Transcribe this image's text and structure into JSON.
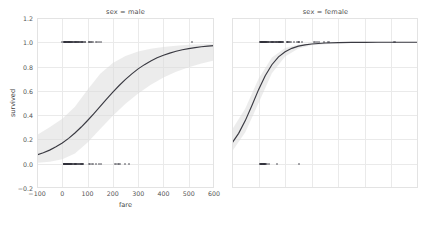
{
  "figure": {
    "kind": "logistic-regression-facet-grid",
    "background": "#ffffff",
    "curve_color": "#3a3a42",
    "band_color": "#d9d9d9",
    "point_color": "#31313a",
    "grid_color": "#eaeaea",
    "frame_color": "#e3e3e3"
  },
  "chart_data": {
    "type": "line",
    "title": "",
    "subtitle": "",
    "xlabel": "fare",
    "ylabel": "survived",
    "xlim": [
      -100,
      600
    ],
    "ylim": [
      -0.2,
      1.2
    ],
    "xticks": [
      -100,
      0,
      100,
      200,
      300,
      400,
      500,
      600
    ],
    "xticklabels": [
      "−100",
      "0",
      "100",
      "200",
      "300",
      "400",
      "500",
      "600"
    ],
    "yticks": [
      -0.2,
      0.0,
      0.2,
      0.4,
      0.6,
      0.8,
      1.0,
      1.2
    ],
    "yticklabels": [
      "−0.2",
      "0.0",
      "0.2",
      "0.4",
      "0.6",
      "0.8",
      "1.0",
      "1.2"
    ],
    "grid": true,
    "legend": "none",
    "facet_variable": "sex",
    "panels": [
      {
        "title": "sex = male",
        "facet_value": "male",
        "series": [
          {
            "name": "logistic fit",
            "x": [
              -100,
              -75,
              -50,
              -25,
              0,
              25,
              50,
              75,
              100,
              125,
              150,
              175,
              200,
              225,
              250,
              275,
              300,
              325,
              350,
              375,
              400,
              425,
              450,
              475,
              500,
              525,
              550,
              575,
              600
            ],
            "values": [
              0.072,
              0.09,
              0.112,
              0.139,
              0.171,
              0.209,
              0.253,
              0.302,
              0.356,
              0.413,
              0.472,
              0.531,
              0.589,
              0.644,
              0.694,
              0.74,
              0.781,
              0.816,
              0.846,
              0.872,
              0.893,
              0.911,
              0.926,
              0.938,
              0.948,
              0.956,
              0.963,
              0.968,
              0.973
            ]
          },
          {
            "name": "95% confidence band lower",
            "x": [
              -100,
              -50,
              0,
              50,
              100,
              150,
              200,
              250,
              300,
              350,
              400,
              450,
              500,
              550,
              600
            ],
            "values": [
              0.008,
              0.016,
              0.036,
              0.085,
              0.175,
              0.286,
              0.396,
              0.494,
              0.578,
              0.65,
              0.709,
              0.757,
              0.795,
              0.826,
              0.851
            ]
          },
          {
            "name": "95% confidence band upper",
            "x": [
              -100,
              -50,
              0,
              50,
              100,
              150,
              200,
              250,
              300,
              350,
              400,
              450,
              500,
              550,
              600
            ],
            "values": [
              0.236,
              0.3,
              0.37,
              0.47,
              0.61,
              0.74,
              0.83,
              0.888,
              0.924,
              0.947,
              0.962,
              0.972,
              0.979,
              0.984,
              0.988
            ]
          }
        ],
        "points": [
          {
            "x": 51,
            "y": 1
          },
          {
            "x": 53,
            "y": 1
          },
          {
            "x": 26,
            "y": 1
          },
          {
            "x": 13,
            "y": 1
          },
          {
            "x": 30,
            "y": 1
          },
          {
            "x": 35,
            "y": 1
          },
          {
            "x": 11,
            "y": 1
          },
          {
            "x": 8,
            "y": 1
          },
          {
            "x": 0,
            "y": 1
          },
          {
            "x": 7,
            "y": 1
          },
          {
            "x": 9,
            "y": 1
          },
          {
            "x": 10,
            "y": 1
          },
          {
            "x": 12,
            "y": 1
          },
          {
            "x": 15,
            "y": 1
          },
          {
            "x": 18,
            "y": 1
          },
          {
            "x": 20,
            "y": 1
          },
          {
            "x": 21,
            "y": 1
          },
          {
            "x": 23,
            "y": 1
          },
          {
            "x": 25,
            "y": 1
          },
          {
            "x": 27,
            "y": 1
          },
          {
            "x": 29,
            "y": 1
          },
          {
            "x": 31,
            "y": 1
          },
          {
            "x": 33,
            "y": 1
          },
          {
            "x": 39,
            "y": 1
          },
          {
            "x": 40,
            "y": 1
          },
          {
            "x": 41,
            "y": 1
          },
          {
            "x": 46,
            "y": 1
          },
          {
            "x": 52,
            "y": 1
          },
          {
            "x": 56,
            "y": 1
          },
          {
            "x": 57,
            "y": 1
          },
          {
            "x": 61,
            "y": 1
          },
          {
            "x": 63,
            "y": 1
          },
          {
            "x": 65,
            "y": 1
          },
          {
            "x": 66,
            "y": 1
          },
          {
            "x": 71,
            "y": 1
          },
          {
            "x": 73,
            "y": 1
          },
          {
            "x": 75,
            "y": 1
          },
          {
            "x": 78,
            "y": 1
          },
          {
            "x": 79,
            "y": 1
          },
          {
            "x": 81,
            "y": 1
          },
          {
            "x": 83,
            "y": 1
          },
          {
            "x": 90,
            "y": 1
          },
          {
            "x": 91,
            "y": 1
          },
          {
            "x": 106,
            "y": 1
          },
          {
            "x": 108,
            "y": 1
          },
          {
            "x": 113,
            "y": 1
          },
          {
            "x": 120,
            "y": 1
          },
          {
            "x": 135,
            "y": 1
          },
          {
            "x": 146,
            "y": 1
          },
          {
            "x": 153,
            "y": 1
          },
          {
            "x": 512,
            "y": 1
          },
          {
            "x": 7,
            "y": 0
          },
          {
            "x": 8,
            "y": 0
          },
          {
            "x": 7.9,
            "y": 0
          },
          {
            "x": 8.05,
            "y": 0
          },
          {
            "x": 8.5,
            "y": 0
          },
          {
            "x": 9,
            "y": 0
          },
          {
            "x": 10,
            "y": 0
          },
          {
            "x": 11,
            "y": 0
          },
          {
            "x": 12,
            "y": 0
          },
          {
            "x": 13,
            "y": 0
          },
          {
            "x": 14,
            "y": 0
          },
          {
            "x": 15,
            "y": 0
          },
          {
            "x": 16,
            "y": 0
          },
          {
            "x": 17,
            "y": 0
          },
          {
            "x": 18,
            "y": 0
          },
          {
            "x": 19,
            "y": 0
          },
          {
            "x": 20,
            "y": 0
          },
          {
            "x": 21,
            "y": 0
          },
          {
            "x": 22,
            "y": 0
          },
          {
            "x": 23,
            "y": 0
          },
          {
            "x": 24,
            "y": 0
          },
          {
            "x": 25,
            "y": 0
          },
          {
            "x": 26,
            "y": 0
          },
          {
            "x": 27,
            "y": 0
          },
          {
            "x": 29,
            "y": 0
          },
          {
            "x": 30,
            "y": 0
          },
          {
            "x": 31,
            "y": 0
          },
          {
            "x": 33,
            "y": 0
          },
          {
            "x": 34,
            "y": 0
          },
          {
            "x": 35,
            "y": 0
          },
          {
            "x": 37,
            "y": 0
          },
          {
            "x": 39,
            "y": 0
          },
          {
            "x": 41,
            "y": 0
          },
          {
            "x": 46,
            "y": 0
          },
          {
            "x": 49,
            "y": 0
          },
          {
            "x": 50,
            "y": 0
          },
          {
            "x": 52,
            "y": 0
          },
          {
            "x": 53,
            "y": 0
          },
          {
            "x": 55,
            "y": 0
          },
          {
            "x": 56,
            "y": 0
          },
          {
            "x": 61,
            "y": 0
          },
          {
            "x": 63,
            "y": 0
          },
          {
            "x": 66,
            "y": 0
          },
          {
            "x": 69,
            "y": 0
          },
          {
            "x": 71,
            "y": 0
          },
          {
            "x": 73,
            "y": 0
          },
          {
            "x": 75,
            "y": 0
          },
          {
            "x": 77,
            "y": 0
          },
          {
            "x": 78,
            "y": 0
          },
          {
            "x": 79,
            "y": 0
          },
          {
            "x": 81,
            "y": 0
          },
          {
            "x": 83,
            "y": 0
          },
          {
            "x": 106,
            "y": 0
          },
          {
            "x": 110,
            "y": 0
          },
          {
            "x": 120,
            "y": 0
          },
          {
            "x": 133,
            "y": 0
          },
          {
            "x": 146,
            "y": 0
          },
          {
            "x": 153,
            "y": 0
          },
          {
            "x": 211,
            "y": 0
          },
          {
            "x": 221,
            "y": 0
          },
          {
            "x": 227,
            "y": 0
          },
          {
            "x": 247,
            "y": 0
          },
          {
            "x": 263,
            "y": 0
          }
        ]
      },
      {
        "title": "sex = female",
        "facet_value": "female",
        "series": [
          {
            "name": "logistic fit",
            "x": [
              -100,
              -75,
              -50,
              -25,
              0,
              25,
              50,
              75,
              100,
              125,
              150,
              175,
              200,
              250,
              300,
              350,
              400,
              450,
              500,
              550,
              600
            ],
            "values": [
              0.17,
              0.25,
              0.355,
              0.48,
              0.61,
              0.725,
              0.815,
              0.88,
              0.922,
              0.95,
              0.968,
              0.979,
              0.986,
              0.994,
              0.997,
              0.999,
              0.999,
              1.0,
              1.0,
              1.0,
              1.0
            ]
          },
          {
            "name": "95% confidence band lower",
            "x": [
              -100,
              -50,
              0,
              50,
              100,
              150,
              200,
              300,
              400,
              500,
              600
            ],
            "values": [
              0.1,
              0.26,
              0.5,
              0.745,
              0.882,
              0.948,
              0.975,
              0.993,
              0.998,
              0.999,
              1.0
            ]
          },
          {
            "name": "95% confidence band upper",
            "x": [
              -100,
              -50,
              0,
              50,
              100,
              150,
              200,
              300,
              400,
              500,
              600
            ],
            "values": [
              0.28,
              0.455,
              0.7,
              0.875,
              0.952,
              0.982,
              0.993,
              0.999,
              1.0,
              1.0,
              1.0
            ]
          }
        ],
        "points": [
          {
            "x": 71,
            "y": 1
          },
          {
            "x": 53,
            "y": 1
          },
          {
            "x": 8,
            "y": 1
          },
          {
            "x": 11,
            "y": 1
          },
          {
            "x": 16,
            "y": 1
          },
          {
            "x": 26,
            "y": 1
          },
          {
            "x": 31,
            "y": 1
          },
          {
            "x": 7,
            "y": 1
          },
          {
            "x": 7.5,
            "y": 1
          },
          {
            "x": 9,
            "y": 1
          },
          {
            "x": 10,
            "y": 1
          },
          {
            "x": 12,
            "y": 1
          },
          {
            "x": 13,
            "y": 1
          },
          {
            "x": 14,
            "y": 1
          },
          {
            "x": 15,
            "y": 1
          },
          {
            "x": 17,
            "y": 1
          },
          {
            "x": 18,
            "y": 1
          },
          {
            "x": 19,
            "y": 1
          },
          {
            "x": 20,
            "y": 1
          },
          {
            "x": 21,
            "y": 1
          },
          {
            "x": 23,
            "y": 1
          },
          {
            "x": 24,
            "y": 1
          },
          {
            "x": 25,
            "y": 1
          },
          {
            "x": 27,
            "y": 1
          },
          {
            "x": 29,
            "y": 1
          },
          {
            "x": 30,
            "y": 1
          },
          {
            "x": 33,
            "y": 1
          },
          {
            "x": 35,
            "y": 1
          },
          {
            "x": 39,
            "y": 1
          },
          {
            "x": 41,
            "y": 1
          },
          {
            "x": 46,
            "y": 1
          },
          {
            "x": 49,
            "y": 1
          },
          {
            "x": 52,
            "y": 1
          },
          {
            "x": 55,
            "y": 1
          },
          {
            "x": 57,
            "y": 1
          },
          {
            "x": 61,
            "y": 1
          },
          {
            "x": 63,
            "y": 1
          },
          {
            "x": 65,
            "y": 1
          },
          {
            "x": 69,
            "y": 1
          },
          {
            "x": 73,
            "y": 1
          },
          {
            "x": 76,
            "y": 1
          },
          {
            "x": 78,
            "y": 1
          },
          {
            "x": 79,
            "y": 1
          },
          {
            "x": 82,
            "y": 1
          },
          {
            "x": 83,
            "y": 1
          },
          {
            "x": 86,
            "y": 1
          },
          {
            "x": 89,
            "y": 1
          },
          {
            "x": 91,
            "y": 1
          },
          {
            "x": 93,
            "y": 1
          },
          {
            "x": 106,
            "y": 1
          },
          {
            "x": 108,
            "y": 1
          },
          {
            "x": 110,
            "y": 1
          },
          {
            "x": 113,
            "y": 1
          },
          {
            "x": 120,
            "y": 1
          },
          {
            "x": 134,
            "y": 1
          },
          {
            "x": 146,
            "y": 1
          },
          {
            "x": 151,
            "y": 1
          },
          {
            "x": 153,
            "y": 1
          },
          {
            "x": 164,
            "y": 1
          },
          {
            "x": 211,
            "y": 1
          },
          {
            "x": 221,
            "y": 1
          },
          {
            "x": 227,
            "y": 1
          },
          {
            "x": 247,
            "y": 1
          },
          {
            "x": 263,
            "y": 1
          },
          {
            "x": 512,
            "y": 1
          },
          {
            "x": 7,
            "y": 0
          },
          {
            "x": 7.75,
            "y": 0
          },
          {
            "x": 8,
            "y": 0
          },
          {
            "x": 9,
            "y": 0
          },
          {
            "x": 10,
            "y": 0
          },
          {
            "x": 12,
            "y": 0
          },
          {
            "x": 14,
            "y": 0
          },
          {
            "x": 15,
            "y": 0
          },
          {
            "x": 16,
            "y": 0
          },
          {
            "x": 17,
            "y": 0
          },
          {
            "x": 18,
            "y": 0
          },
          {
            "x": 20,
            "y": 0
          },
          {
            "x": 21,
            "y": 0
          },
          {
            "x": 23,
            "y": 0
          },
          {
            "x": 24,
            "y": 0
          },
          {
            "x": 25,
            "y": 0
          },
          {
            "x": 26,
            "y": 0
          },
          {
            "x": 31,
            "y": 0
          },
          {
            "x": 39,
            "y": 0
          },
          {
            "x": 69,
            "y": 0
          },
          {
            "x": 151,
            "y": 0
          }
        ]
      }
    ]
  }
}
